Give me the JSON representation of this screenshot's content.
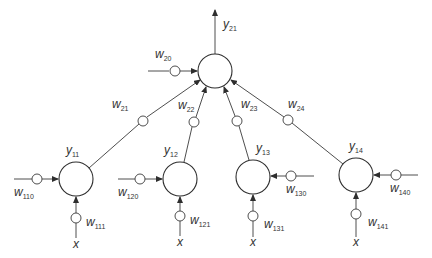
{
  "diagram": {
    "title": "",
    "colors": {
      "stroke": "#2e2e2e",
      "text": "#333333",
      "background": "#ffffff"
    },
    "output_node": {
      "id": "y21",
      "label": "y",
      "sub": "21",
      "cx": 215,
      "cy": 71,
      "r": 17
    },
    "output_bias": {
      "label": "w",
      "sub": "20",
      "cx": 175,
      "cy": 71
    },
    "hidden_nodes": [
      {
        "id": "y11",
        "label": "y",
        "sub": "11",
        "cx": 76,
        "cy": 179,
        "r": 17
      },
      {
        "id": "y12",
        "label": "y",
        "sub": "12",
        "cx": 180,
        "cy": 179,
        "r": 17
      },
      {
        "id": "y13",
        "label": "y",
        "sub": "13",
        "cx": 253,
        "cy": 177,
        "r": 17
      },
      {
        "id": "y14",
        "label": "y",
        "sub": "14",
        "cx": 356,
        "cy": 175,
        "r": 17
      }
    ],
    "hidden_to_output_weights": [
      {
        "label": "w",
        "sub": "21",
        "cx": 143,
        "cy": 121
      },
      {
        "label": "w",
        "sub": "22",
        "cx": 194,
        "cy": 122
      },
      {
        "label": "w",
        "sub": "23",
        "cx": 237,
        "cy": 121
      },
      {
        "label": "w",
        "sub": "24",
        "cx": 288,
        "cy": 120
      }
    ],
    "bias_weights": [
      {
        "label": "w",
        "sub": "110",
        "side": "left"
      },
      {
        "label": "w",
        "sub": "120",
        "side": "left"
      },
      {
        "label": "w",
        "sub": "130",
        "side": "right"
      },
      {
        "label": "w",
        "sub": "140",
        "side": "right"
      }
    ],
    "input_weights": [
      {
        "label": "w",
        "sub": "111"
      },
      {
        "label": "w",
        "sub": "121"
      },
      {
        "label": "w",
        "sub": "131"
      },
      {
        "label": "w",
        "sub": "141"
      }
    ],
    "inputs": [
      {
        "label": "x"
      },
      {
        "label": "x"
      },
      {
        "label": "x"
      },
      {
        "label": "x"
      }
    ]
  }
}
